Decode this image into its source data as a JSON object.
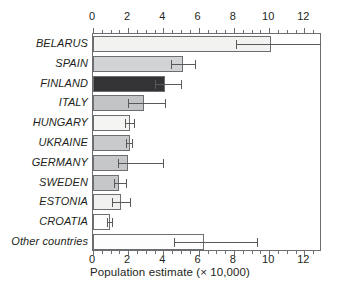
{
  "chart_data": {
    "type": "bar",
    "orientation": "horizontal",
    "title": "",
    "xlabel": "Population estimate (× 10,000)",
    "ylabel": "",
    "xlim": [
      0,
      13.0
    ],
    "xticks": [
      0,
      2,
      4,
      6,
      8,
      10,
      12
    ],
    "xtick_labels": [
      "0",
      "2",
      "4",
      "6",
      "8",
      "10",
      "12"
    ],
    "minor_tick_step": 0.5,
    "grid": false,
    "legend": null,
    "axis_top": true,
    "axis_bottom": true,
    "categories": [
      "BELARUS",
      "SPAIN",
      "FINLAND",
      "ITALY",
      "HUNGARY",
      "UKRAINE",
      "GERMANY",
      "SWEDEN",
      "ESTONIA",
      "CROATIA",
      "Other countries"
    ],
    "values": [
      10.1,
      5.1,
      4.1,
      2.9,
      2.1,
      2.1,
      2.0,
      1.5,
      1.6,
      0.95,
      6.3
    ],
    "error_low": [
      8.1,
      4.4,
      3.5,
      2.0,
      1.8,
      1.9,
      1.4,
      1.2,
      1.1,
      0.8,
      4.6
    ],
    "error_high": [
      13.0,
      5.8,
      5.0,
      4.1,
      2.3,
      2.2,
      4.0,
      1.9,
      2.1,
      1.1,
      9.3
    ],
    "bar_colors": [
      "#f2f2f1",
      "#d2d3d4",
      "#333335",
      "#c3c4c5",
      "#f4f4f3",
      "#c9cacb",
      "#c6c7c8",
      "#c6c7c8",
      "#f0f0ef",
      "#fdfdfd",
      "#fdfdfd"
    ],
    "bar_edge_color": "#6d6e71",
    "error_bar_color": "#58595b",
    "text_color": "#231f20"
  }
}
